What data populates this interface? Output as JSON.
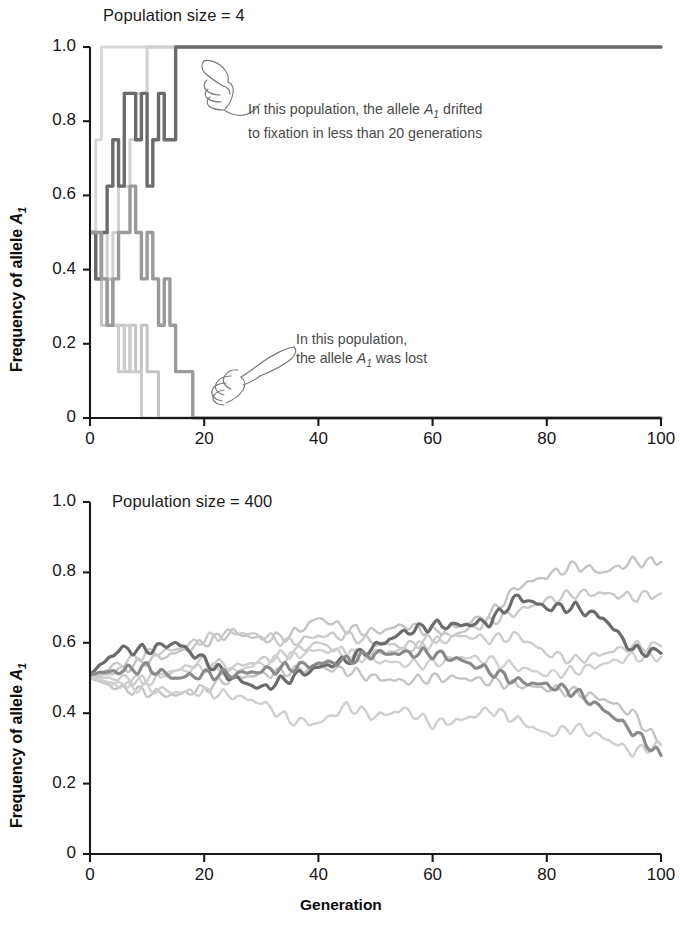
{
  "figure": {
    "x_axis_title": "Generation",
    "y_axis_title_prefix": "Frequency of allele ",
    "y_axis_allele": "A",
    "y_axis_allele_sub": "1"
  },
  "panels": {
    "top": {
      "title": "Population size = 4",
      "y_ticks": [
        "1.0",
        "0.8",
        "0.6",
        "0.4",
        "0.2",
        "0"
      ],
      "x_ticks": [
        "0",
        "20",
        "40",
        "60",
        "80",
        "100"
      ],
      "annotations": [
        {
          "name": "fixation-annotation",
          "line1_a": "In this population, the allele ",
          "line1_allele": "A",
          "line1_allele_sub": "1",
          "line1_b": " drifted",
          "line2": "to fixation in less than 20 generations",
          "icon": "pointing-hand-icon"
        },
        {
          "name": "loss-annotation",
          "line1_a": "In this population,",
          "line2_a": "the allele ",
          "line2_allele": "A",
          "line2_allele_sub": "1",
          "line2_b": " was lost",
          "icon": "pointing-hand-icon"
        }
      ]
    },
    "bottom": {
      "title": "Population size = 400",
      "y_ticks": [
        "1.0",
        "0.8",
        "0.6",
        "0.4",
        "0.2",
        "0"
      ],
      "x_ticks": [
        "0",
        "20",
        "40",
        "60",
        "80",
        "100"
      ]
    }
  },
  "colors": {
    "highlight_line": "#6b6b6b",
    "mid_line": "#9a9a9a",
    "light_line": "#c4c4c4",
    "pale_line": "#d8d8d8",
    "axis": "#1a1a1a",
    "annotation_text": "#4a4a4a"
  },
  "chart_data": [
    {
      "type": "line",
      "title": "Population size = 4",
      "xlabel": "",
      "ylabel": "Frequency of allele A1",
      "xlim": [
        0,
        100
      ],
      "ylim": [
        0,
        1.0
      ],
      "xticks": [
        0,
        20,
        40,
        60,
        80,
        100
      ],
      "yticks": [
        0,
        0.2,
        0.4,
        0.6,
        0.8,
        1.0
      ],
      "grid": false,
      "legend": "none",
      "note": "Wright-Fisher drift simulation, N=4 (8 alleles); frequencies are multiples of 0.125; several replicate populations fix or are lost within ~20 generations",
      "series": [
        {
          "name": "population-fixed-dark",
          "color": "#6b6b6b",
          "emphasis": true,
          "x": [
            0,
            1,
            2,
            3,
            4,
            5,
            6,
            7,
            8,
            9,
            10,
            11,
            12,
            13,
            14,
            15,
            16,
            20,
            40,
            60,
            80,
            100
          ],
          "values": [
            0.5,
            0.375,
            0.5,
            0.625,
            0.75,
            0.625,
            0.875,
            0.875,
            0.75,
            0.875,
            0.625,
            0.75,
            0.875,
            0.75,
            0.75,
            1.0,
            1.0,
            1.0,
            1.0,
            1.0,
            1.0,
            1.0
          ]
        },
        {
          "name": "population-lost-mid",
          "color": "#9a9a9a",
          "emphasis": true,
          "x": [
            0,
            1,
            2,
            3,
            4,
            5,
            6,
            7,
            8,
            9,
            10,
            11,
            12,
            13,
            14,
            15,
            16,
            17,
            18,
            19,
            20,
            40,
            60,
            80,
            100
          ],
          "values": [
            0.5,
            0.5,
            0.375,
            0.25,
            0.375,
            0.5,
            0.5,
            0.625,
            0.5,
            0.375,
            0.5,
            0.375,
            0.25,
            0.375,
            0.25,
            0.125,
            0.125,
            0.125,
            0.0,
            0.0,
            0.0,
            0.0,
            0.0,
            0.0,
            0.0
          ]
        },
        {
          "name": "population-fixed-pale-a",
          "color": "#d8d8d8",
          "emphasis": false,
          "x": [
            0,
            1,
            2,
            3,
            100
          ],
          "values": [
            0.5,
            0.75,
            1.0,
            1.0,
            1.0
          ]
        },
        {
          "name": "population-fixed-pale-b",
          "color": "#d0d0d0",
          "emphasis": false,
          "x": [
            0,
            1,
            2,
            3,
            4,
            5,
            6,
            7,
            8,
            9,
            10,
            11,
            12,
            100
          ],
          "values": [
            0.5,
            0.375,
            0.5,
            0.375,
            0.5,
            0.625,
            0.625,
            0.75,
            0.875,
            0.875,
            1.0,
            1.0,
            1.0,
            1.0
          ]
        },
        {
          "name": "population-lost-light-a",
          "color": "#c4c4c4",
          "emphasis": false,
          "x": [
            0,
            1,
            2,
            3,
            4,
            5,
            6,
            7,
            8,
            9,
            10,
            11,
            12,
            13,
            100
          ],
          "values": [
            0.5,
            0.375,
            0.25,
            0.375,
            0.25,
            0.25,
            0.125,
            0.25,
            0.125,
            0.25,
            0.125,
            0.125,
            0.0,
            0.0,
            0.0
          ]
        },
        {
          "name": "population-lost-light-b",
          "color": "#cccccc",
          "emphasis": false,
          "x": [
            0,
            1,
            2,
            3,
            4,
            5,
            6,
            7,
            8,
            9,
            10,
            100
          ],
          "values": [
            0.5,
            0.5,
            0.375,
            0.25,
            0.25,
            0.125,
            0.25,
            0.125,
            0.125,
            0.0,
            0.0,
            0.0
          ]
        }
      ]
    },
    {
      "type": "line",
      "title": "Population size = 400",
      "xlabel": "Generation",
      "ylabel": "Frequency of allele A1",
      "xlim": [
        0,
        100
      ],
      "ylim": [
        0,
        1.0
      ],
      "xticks": [
        0,
        20,
        40,
        60,
        80,
        100
      ],
      "yticks": [
        0,
        0.2,
        0.4,
        0.6,
        0.8,
        1.0
      ],
      "grid": false,
      "legend": "none",
      "note": "Wright-Fisher drift simulation, N=400; all replicate populations start at 0.5 and wander between about 0.27 and 0.84 after 100 generations; none fix or are lost",
      "series": [
        {
          "name": "population-dark-highlight",
          "color": "#6b6b6b",
          "emphasis": true,
          "x": [
            0,
            5,
            10,
            15,
            20,
            25,
            30,
            35,
            40,
            45,
            50,
            55,
            60,
            65,
            70,
            75,
            80,
            85,
            90,
            95,
            100
          ],
          "values": [
            0.51,
            0.58,
            0.58,
            0.6,
            0.55,
            0.5,
            0.47,
            0.5,
            0.53,
            0.55,
            0.59,
            0.63,
            0.65,
            0.65,
            0.66,
            0.73,
            0.7,
            0.7,
            0.67,
            0.58,
            0.57
          ]
        },
        {
          "name": "population-dark-decline",
          "color": "#8a8a8a",
          "emphasis": true,
          "x": [
            0,
            5,
            10,
            15,
            20,
            25,
            30,
            35,
            40,
            45,
            50,
            55,
            60,
            65,
            70,
            75,
            80,
            85,
            90,
            95,
            100
          ],
          "values": [
            0.51,
            0.52,
            0.53,
            0.5,
            0.51,
            0.51,
            0.52,
            0.53,
            0.54,
            0.55,
            0.57,
            0.57,
            0.57,
            0.55,
            0.52,
            0.49,
            0.48,
            0.46,
            0.41,
            0.35,
            0.28
          ]
        },
        {
          "name": "population-light-rising-top",
          "color": "#c4c4c4",
          "emphasis": false,
          "x": [
            0,
            5,
            10,
            15,
            20,
            25,
            30,
            35,
            40,
            45,
            50,
            55,
            60,
            65,
            70,
            75,
            80,
            85,
            90,
            95,
            100
          ],
          "values": [
            0.5,
            0.52,
            0.55,
            0.57,
            0.6,
            0.63,
            0.61,
            0.62,
            0.67,
            0.64,
            0.63,
            0.65,
            0.63,
            0.65,
            0.68,
            0.76,
            0.79,
            0.82,
            0.8,
            0.83,
            0.83
          ]
        },
        {
          "name": "population-light-rising-second",
          "color": "#c9c9c9",
          "emphasis": false,
          "x": [
            0,
            5,
            10,
            15,
            20,
            25,
            30,
            35,
            40,
            45,
            50,
            55,
            60,
            65,
            70,
            75,
            80,
            85,
            90,
            95,
            100
          ],
          "values": [
            0.5,
            0.54,
            0.57,
            0.58,
            0.61,
            0.63,
            0.62,
            0.6,
            0.62,
            0.62,
            0.6,
            0.59,
            0.61,
            0.63,
            0.66,
            0.69,
            0.72,
            0.74,
            0.74,
            0.73,
            0.74
          ]
        },
        {
          "name": "population-light-flat-mid",
          "color": "#cccccc",
          "emphasis": false,
          "x": [
            0,
            5,
            10,
            15,
            20,
            25,
            30,
            35,
            40,
            45,
            50,
            55,
            60,
            65,
            70,
            75,
            80,
            85,
            90,
            95,
            100
          ],
          "values": [
            0.5,
            0.5,
            0.49,
            0.52,
            0.55,
            0.53,
            0.55,
            0.57,
            0.6,
            0.57,
            0.57,
            0.58,
            0.6,
            0.62,
            0.61,
            0.62,
            0.57,
            0.55,
            0.57,
            0.59,
            0.59
          ]
        },
        {
          "name": "population-light-middle-band",
          "color": "#d0d0d0",
          "emphasis": false,
          "x": [
            0,
            5,
            10,
            15,
            20,
            25,
            30,
            35,
            40,
            45,
            50,
            55,
            60,
            65,
            70,
            75,
            80,
            85,
            90,
            95,
            100
          ],
          "values": [
            0.5,
            0.48,
            0.5,
            0.52,
            0.53,
            0.52,
            0.54,
            0.56,
            0.58,
            0.57,
            0.55,
            0.54,
            0.54,
            0.56,
            0.55,
            0.53,
            0.51,
            0.52,
            0.54,
            0.56,
            0.56
          ]
        },
        {
          "name": "population-light-declining",
          "color": "#c4c4c4",
          "emphasis": false,
          "x": [
            0,
            5,
            10,
            15,
            20,
            25,
            30,
            35,
            40,
            45,
            50,
            55,
            60,
            65,
            70,
            75,
            80,
            85,
            90,
            95,
            100
          ],
          "values": [
            0.5,
            0.47,
            0.46,
            0.45,
            0.47,
            0.5,
            0.51,
            0.52,
            0.53,
            0.52,
            0.5,
            0.49,
            0.5,
            0.5,
            0.49,
            0.48,
            0.47,
            0.46,
            0.44,
            0.4,
            0.31
          ]
        },
        {
          "name": "population-light-lowest",
          "color": "#cfcfcf",
          "emphasis": false,
          "x": [
            0,
            5,
            10,
            15,
            20,
            25,
            30,
            35,
            40,
            45,
            50,
            55,
            60,
            65,
            70,
            75,
            80,
            85,
            90,
            95,
            100
          ],
          "values": [
            0.5,
            0.48,
            0.47,
            0.46,
            0.46,
            0.45,
            0.43,
            0.38,
            0.37,
            0.42,
            0.39,
            0.41,
            0.37,
            0.38,
            0.41,
            0.38,
            0.34,
            0.36,
            0.33,
            0.29,
            0.31
          ]
        }
      ]
    }
  ]
}
